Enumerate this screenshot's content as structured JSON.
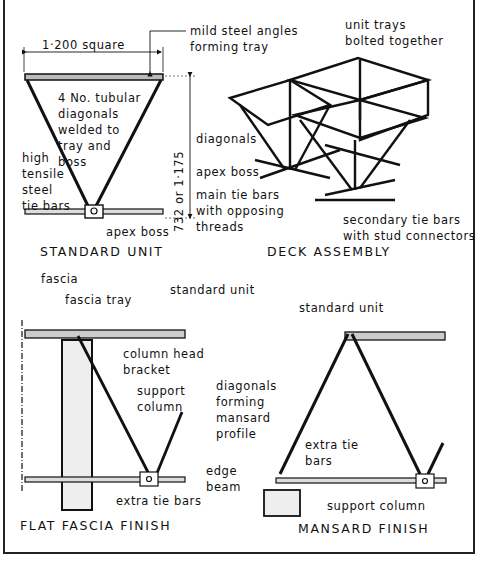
{
  "figure": {
    "panels": [
      {
        "id": "standard-unit",
        "caption": "STANDARD UNIT",
        "labels": {
          "dimension_width": "1·200 square",
          "dimension_height": "732 or 1·175",
          "mild_steel": "mild steel angles\nforming tray",
          "tubular": "4 No. tubular\ndiagonals\nwelded to\ntray and\nboss",
          "tie_bars": "high\ntensile\nsteel\ntie bars",
          "apex_boss": "apex boss"
        }
      },
      {
        "id": "deck-assembly",
        "caption": "DECK ASSEMBLY",
        "labels": {
          "unit_trays": "unit trays\nbolted together",
          "diagonals": "diagonals",
          "apex_boss": "apex boss",
          "main_tie": "main tie bars\nwith opposing\nthreads",
          "secondary": "secondary tie bars\nwith stud connectors"
        }
      },
      {
        "id": "flat-fascia-finish",
        "caption": "FLAT FASCIA FINISH",
        "labels": {
          "fascia": "fascia",
          "fascia_tray": "fascia tray",
          "standard_unit": "standard unit",
          "column_head": "column head\nbracket",
          "support_column": "support\ncolumn",
          "extra_tie": "extra tie bars"
        }
      },
      {
        "id": "mansard-finish",
        "caption": "MANSARD FINISH",
        "labels": {
          "standard_unit": "standard unit",
          "diagonals": "diagonals\nforming\nmansard\nprofile",
          "extra_tie": "extra tie\nbars",
          "edge_beam": "edge\nbeam",
          "support_column": "support column"
        }
      }
    ]
  }
}
